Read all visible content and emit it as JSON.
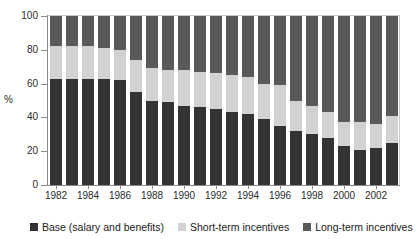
{
  "chart_data": {
    "type": "bar",
    "subtype": "stacked-bar-100-percent",
    "title": "",
    "subtitle": "",
    "xlabel": "",
    "ylabel": "%",
    "ylim": [
      0,
      100
    ],
    "yticks": [
      0,
      20,
      40,
      60,
      80,
      100
    ],
    "ytick_labels": [
      "0",
      "20",
      "40",
      "60",
      "80",
      "100"
    ],
    "grid": false,
    "legend_position": "bottom",
    "categories": [
      "1982",
      "1983",
      "1984",
      "1985",
      "1986",
      "1987",
      "1988",
      "1989",
      "1990",
      "1991",
      "1992",
      "1993",
      "1994",
      "1995",
      "1996",
      "1997",
      "1998",
      "1999",
      "2000",
      "2001",
      "2002",
      "2003"
    ],
    "xtick_labels": [
      "1982",
      "1984",
      "1986",
      "1988",
      "1990",
      "1992",
      "1994",
      "1996",
      "1998",
      "2000",
      "2002"
    ],
    "series": [
      {
        "name": "Base (salary and benefits)",
        "color": "#333333",
        "values": [
          63,
          63,
          63,
          63,
          62,
          55,
          50,
          49,
          47,
          46,
          45,
          43,
          42,
          39,
          35,
          32,
          30,
          28,
          23,
          21,
          22,
          25
        ]
      },
      {
        "name": "Short-term incentives",
        "color": "#d2d2d2",
        "values": [
          19,
          19,
          19,
          18,
          18,
          19,
          19,
          19,
          21,
          21,
          21,
          22,
          22,
          21,
          24,
          18,
          17,
          15,
          14,
          16,
          14,
          16
        ]
      },
      {
        "name": "Long-term incentives",
        "color": "#595959",
        "values": [
          18,
          18,
          18,
          19,
          20,
          26,
          31,
          32,
          32,
          33,
          34,
          35,
          36,
          40,
          41,
          50,
          53,
          57,
          63,
          63,
          64,
          59
        ]
      }
    ]
  },
  "axis": {
    "y_title": "%"
  },
  "legend": {
    "items": [
      {
        "label": "Base (salary and benefits)",
        "color": "#333333",
        "swatch_name": "legend-swatch-base"
      },
      {
        "label": "Short-term incentives",
        "color": "#d2d2d2",
        "swatch_name": "legend-swatch-short-term"
      },
      {
        "label": "Long-term incentives",
        "color": "#595959",
        "swatch_name": "legend-swatch-long-term"
      }
    ]
  }
}
